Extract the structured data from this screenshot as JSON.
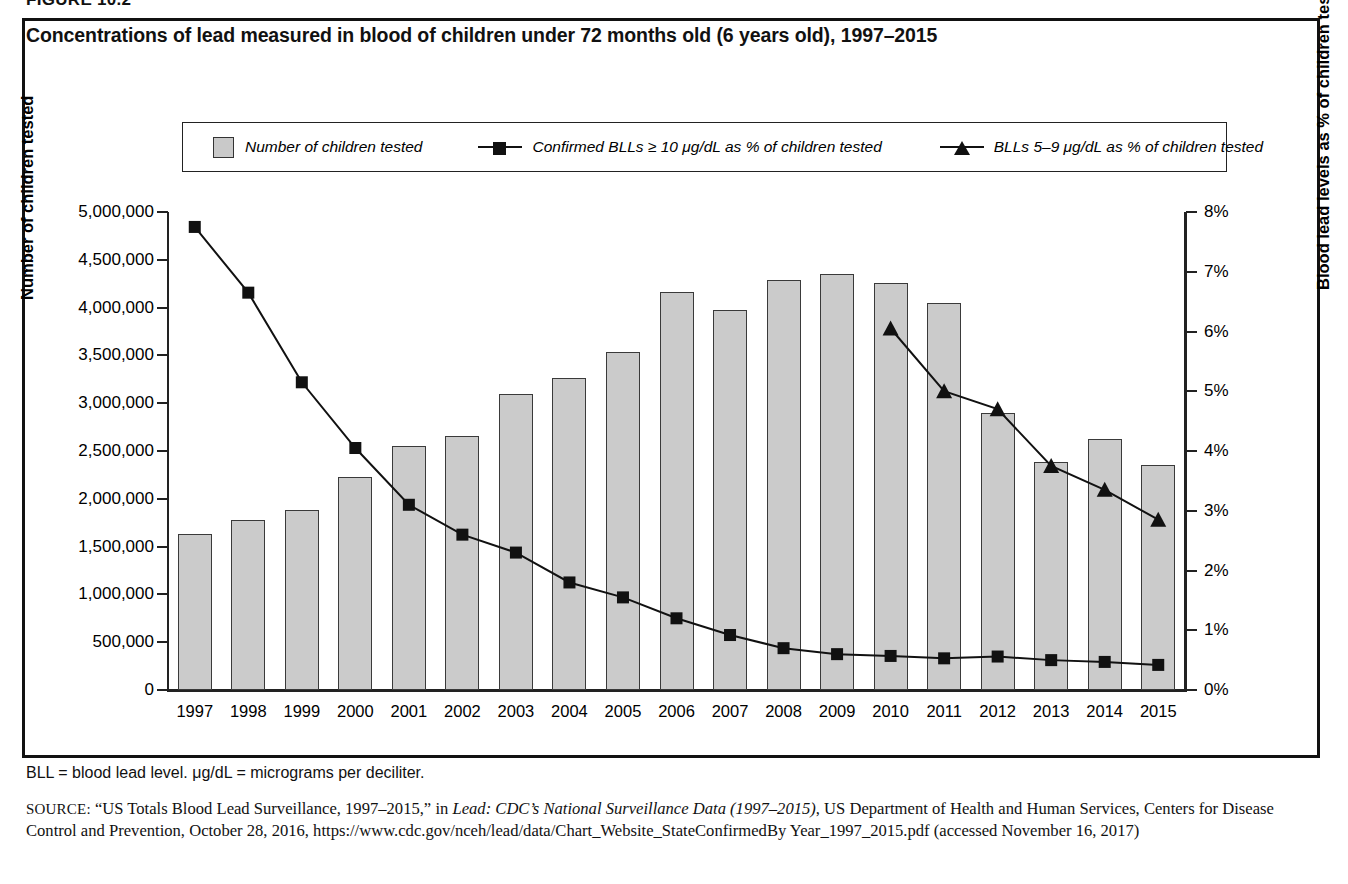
{
  "figure_number": "FIGURE 10.2",
  "title": "Concentrations of lead measured in blood of children under 72 months old (6 years old), 1997–2015",
  "legend": {
    "bar_label": "Number of children tested",
    "square_label": "Confirmed BLLs ≥ 10 μg/dL as % of children tested",
    "triangle_label": "BLLs 5–9 μg/dL as % of children tested"
  },
  "axis_titles": {
    "left": "Number of children tested",
    "right": "Blood lead levels as % of children tested"
  },
  "notes": {
    "abbreviations": "BLL = blood lead level. μg/dL = micrograms per deciliter.",
    "source_prefix": "SOURCE:",
    "source_part1": " “US Totals Blood Lead Surveillance, 1997–2015,” in ",
    "source_italic1": "Lead: CDC’s National Surveillance Data (1997–2015)",
    "source_part2": ", US Department of Health and Human Services, Centers for Disease Control and Prevention, October 28, 2016, https://www.cdc.gov/nceh/lead/data/Chart_Website_StateConfirmedBy Year_1997_2015.pdf (accessed November 16, 2017)"
  },
  "colors": {
    "bar_fill": "#cbcbcb",
    "bar_border": "#3a3a3a",
    "line": "#111111",
    "frame": "#111111"
  },
  "chart_data": {
    "type": "bar",
    "title": "Concentrations of lead measured in blood of children under 72 months old (6 years old), 1997–2015",
    "xlabel": "",
    "ylabel": "Number of children tested",
    "y2label": "Blood lead levels as % of children tested",
    "grid": false,
    "legend_position": "top",
    "categories": [
      "1997",
      "1998",
      "1999",
      "2000",
      "2001",
      "2002",
      "2003",
      "2004",
      "2005",
      "2006",
      "2007",
      "2008",
      "2009",
      "2010",
      "2011",
      "2012",
      "2013",
      "2014",
      "2015"
    ],
    "ylim": [
      0,
      5000000
    ],
    "ytick_labels": [
      "0",
      "500,000",
      "1,000,000",
      "1,500,000",
      "2,000,000",
      "2,500,000",
      "3,000,000",
      "3,500,000",
      "4,000,000",
      "4,500,000",
      "5,000,000"
    ],
    "ytick_values": [
      0,
      500000,
      1000000,
      1500000,
      2000000,
      2500000,
      3000000,
      3500000,
      4000000,
      4500000,
      5000000
    ],
    "y2lim": [
      0,
      8
    ],
    "y2tick_labels": [
      "0%",
      "1%",
      "2%",
      "3%",
      "4%",
      "5%",
      "6%",
      "7%",
      "8%"
    ],
    "y2tick_values": [
      0,
      1,
      2,
      3,
      4,
      5,
      6,
      7,
      8
    ],
    "series": [
      {
        "name": "Number of children tested",
        "type": "bar",
        "axis": "left",
        "values": [
          1630000,
          1775000,
          1885000,
          2230000,
          2550000,
          2660000,
          3100000,
          3260000,
          3540000,
          4165000,
          3980000,
          4290000,
          4350000,
          4255000,
          4050000,
          2900000,
          2380000,
          2630000,
          2355000
        ]
      },
      {
        "name": "Confirmed BLLs ≥ 10 μg/dL as % of children tested",
        "type": "line",
        "marker": "square",
        "axis": "right",
        "values": [
          7.75,
          6.65,
          5.15,
          4.05,
          3.1,
          2.6,
          2.3,
          1.8,
          1.55,
          1.2,
          0.92,
          0.7,
          0.6,
          0.57,
          0.53,
          0.56,
          0.5,
          0.47,
          0.42
        ]
      },
      {
        "name": "BLLs 5–9 μg/dL as % of children tested",
        "type": "line",
        "marker": "triangle",
        "axis": "right",
        "values": [
          null,
          null,
          null,
          null,
          null,
          null,
          null,
          null,
          null,
          null,
          null,
          null,
          null,
          6.05,
          5.0,
          4.7,
          3.75,
          3.35,
          2.85
        ]
      }
    ]
  }
}
